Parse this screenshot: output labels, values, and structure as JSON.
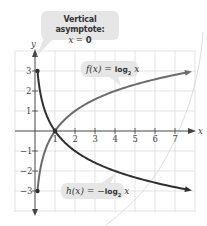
{
  "chart_data": {
    "type": "line",
    "title": "",
    "xlabel": "x",
    "ylabel": "y",
    "xlim": [
      -0.3,
      8
    ],
    "ylim": [
      -4,
      4
    ],
    "grid": true,
    "x_ticks": [
      "1",
      "2",
      "3",
      "4",
      "5",
      "6",
      "7"
    ],
    "y_ticks": [
      "3",
      "2",
      "1",
      "-1",
      "-2",
      "-3"
    ],
    "series": [
      {
        "name": "f(x) = log2 x",
        "color": "#6b6b6b",
        "x": [
          0.125,
          0.25,
          0.5,
          1,
          2,
          4,
          7.8
        ],
        "values": [
          -3,
          -2,
          -1,
          0,
          1,
          2,
          2.96
        ]
      },
      {
        "name": "h(x) = -log2 x",
        "color": "#2f2f2f",
        "x": [
          0.125,
          0.25,
          0.5,
          1,
          2,
          4,
          7.8
        ],
        "values": [
          3,
          2,
          1,
          0,
          -1,
          -2,
          -2.96
        ]
      }
    ],
    "points": [
      {
        "x": 0.125,
        "y": 3
      },
      {
        "x": 1,
        "y": 0
      },
      {
        "x": 0.125,
        "y": -3
      }
    ],
    "annotations": [
      {
        "text": "Vertical asymptote:",
        "subtext": "x = 0"
      },
      {
        "text": "f(x) = log2 x"
      },
      {
        "text": "h(x) = -log2 x"
      }
    ]
  },
  "labels": {
    "asymptote_title": "Vertical asymptote:",
    "asymptote_eq_var": "x",
    "asymptote_eq_rest": " = ",
    "asymptote_eq_val": "0",
    "f_lhs": "f(x) = ",
    "f_fn": "log",
    "f_base": "2",
    "f_var": " x",
    "h_lhs": "h(x) = −",
    "h_fn": "log",
    "h_base": "2",
    "h_var": " x",
    "x_axis": "x",
    "y_axis": "y"
  },
  "colors": {
    "f_curve": "#6b6b6b",
    "h_curve": "#2f2f2f",
    "grid": "#dcdcdc",
    "axis": "#444444",
    "callout_bg": "#e6e6e6"
  }
}
